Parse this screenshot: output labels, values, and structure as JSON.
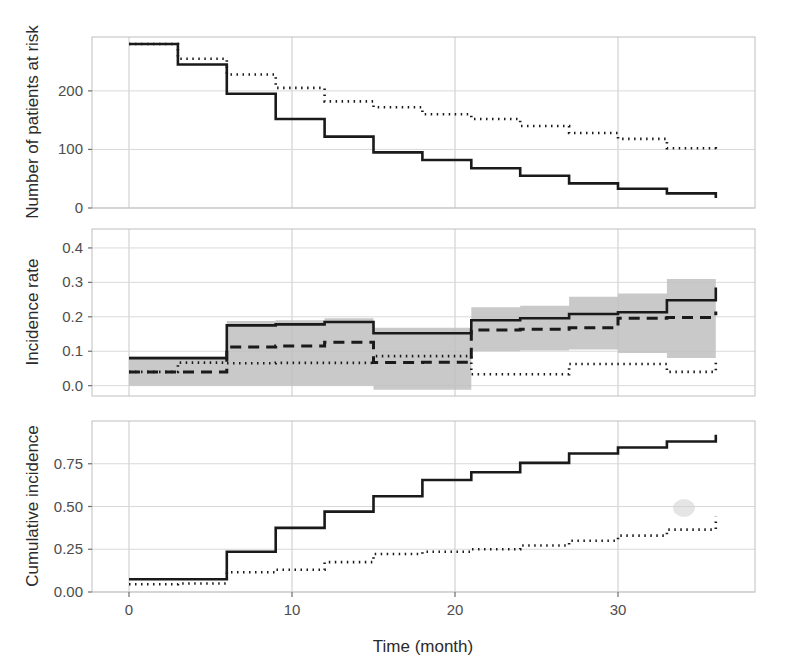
{
  "figure": {
    "xlabel": "Time (month)",
    "background": "#ffffff",
    "line_color": "#1a1a1a",
    "ribbon_color": "#bfbfbf",
    "grid_color": "#d9d9d9"
  },
  "chart_data": [
    {
      "type": "line",
      "panel": "top",
      "title": "",
      "xlabel": "",
      "ylabel": "Number of patients at risk",
      "xlim": [
        -1,
        37
      ],
      "ylim": [
        0,
        292
      ],
      "xticks": [
        0,
        10,
        20,
        30
      ],
      "xticklabels": [
        "0",
        "10",
        "20",
        "30"
      ],
      "yticks": [
        0,
        100,
        200
      ],
      "yticklabels": [
        "0",
        "100",
        "200"
      ],
      "grid": true,
      "legend": "none",
      "x": [
        0,
        3,
        6,
        9,
        12,
        15,
        18,
        21,
        24,
        27,
        30,
        33,
        36
      ],
      "series": [
        {
          "name": "solid-group",
          "style": "solid",
          "values": [
            280,
            245,
            195,
            152,
            122,
            95,
            82,
            68,
            55,
            42,
            33,
            25,
            17
          ]
        },
        {
          "name": "dotted-group",
          "style": "dotted",
          "values": [
            280,
            255,
            228,
            205,
            182,
            172,
            160,
            152,
            140,
            128,
            118,
            102,
            100
          ]
        }
      ]
    },
    {
      "type": "line",
      "panel": "middle",
      "title": "",
      "xlabel": "",
      "ylabel": "Incidence rate",
      "xlim": [
        -1,
        37
      ],
      "ylim": [
        -0.03,
        0.455
      ],
      "xticks": [
        0,
        10,
        20,
        30
      ],
      "xticklabels": [
        "0",
        "10",
        "20",
        "30"
      ],
      "yticks": [
        0.0,
        0.1,
        0.2,
        0.3,
        0.4
      ],
      "yticklabels": [
        "0.0",
        "0.1",
        "0.2",
        "0.3",
        "0.4"
      ],
      "grid": true,
      "legend": "none",
      "x": [
        0,
        3,
        6,
        9,
        12,
        15,
        18,
        21,
        24,
        27,
        30,
        33,
        36
      ],
      "series": [
        {
          "name": "overall-solid",
          "style": "solid",
          "values": [
            0.08,
            0.08,
            0.175,
            0.178,
            0.185,
            0.152,
            0.152,
            0.19,
            0.196,
            0.208,
            0.213,
            0.248,
            0.285
          ]
        },
        {
          "name": "dashed-estimate",
          "style": "dashed",
          "values": [
            0.04,
            0.04,
            0.112,
            0.115,
            0.126,
            0.067,
            0.068,
            0.162,
            0.164,
            0.168,
            0.196,
            0.198,
            0.215
          ]
        },
        {
          "name": "dotted-group",
          "style": "dotted",
          "values": [
            0.04,
            0.067,
            0.065,
            0.066,
            0.066,
            0.086,
            0.086,
            0.033,
            0.033,
            0.063,
            0.063,
            0.04,
            0.072
          ]
        }
      ],
      "ribbon": {
        "name": "confidence-band",
        "lower": [
          0.0,
          0.0,
          0.0,
          0.0,
          0.0,
          -0.012,
          -0.012,
          0.1,
          0.102,
          0.105,
          0.095,
          0.08,
          0.075
        ],
        "upper": [
          0.085,
          0.085,
          0.188,
          0.19,
          0.196,
          0.168,
          0.168,
          0.228,
          0.232,
          0.258,
          0.268,
          0.31,
          0.448
        ]
      }
    },
    {
      "type": "line",
      "panel": "bottom",
      "title": "",
      "xlabel": "Time (month)",
      "ylabel": "Cumulative incidence",
      "xlim": [
        -1,
        37
      ],
      "ylim": [
        0.0,
        1.0
      ],
      "xticks": [
        0,
        10,
        20,
        30
      ],
      "xticklabels": [
        "0",
        "10",
        "20",
        "30"
      ],
      "yticks": [
        0.0,
        0.25,
        0.5,
        0.75
      ],
      "yticklabels": [
        "0.00",
        "0.25",
        "0.50",
        "0.75"
      ],
      "grid": true,
      "legend": "none",
      "x": [
        0,
        3,
        6,
        9,
        12,
        15,
        18,
        21,
        24,
        27,
        30,
        33,
        36
      ],
      "series": [
        {
          "name": "solid-group",
          "style": "solid",
          "values": [
            0.075,
            0.075,
            0.235,
            0.375,
            0.47,
            0.56,
            0.655,
            0.7,
            0.755,
            0.81,
            0.845,
            0.88,
            0.92
          ]
        },
        {
          "name": "dotted-group",
          "style": "dotted",
          "values": [
            0.045,
            0.05,
            0.115,
            0.13,
            0.175,
            0.222,
            0.235,
            0.25,
            0.272,
            0.3,
            0.33,
            0.365,
            0.44
          ]
        }
      ]
    }
  ]
}
